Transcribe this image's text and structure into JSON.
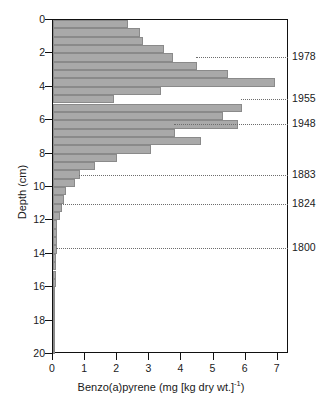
{
  "chart_data": {
    "type": "bar",
    "orientation": "horizontal",
    "title": "",
    "subtitle": "",
    "xlabel": "Benzo(a)pyrene (mg [kg dry wt.]⁻¹)",
    "xlabel_main": "Benzo(a)pyrene (mg [kg dry wt.]",
    "xlabel_sup": "-1",
    "xlabel_tail": ")",
    "ylabel": "Depth (cm)",
    "xlim": [
      0,
      7.35
    ],
    "ylim": [
      0,
      20
    ],
    "grid": false,
    "legend": null,
    "bar_interval_cm": 0.5,
    "bar_color": "#a9a9a9",
    "bar_edge_color": "#8a8a8a",
    "axis_color": "#111111",
    "xticks": [
      0,
      1,
      2,
      3,
      4,
      5,
      6,
      7
    ],
    "xtick_labels": [
      "0",
      "1",
      "2",
      "3",
      "4",
      "5",
      "6",
      "7"
    ],
    "yticks": [
      0,
      2,
      4,
      6,
      8,
      10,
      12,
      14,
      16,
      18,
      20
    ],
    "ytick_labels": [
      "0",
      "2",
      "4",
      "6",
      "8",
      "10",
      "12",
      "14",
      "16",
      "18",
      "20"
    ],
    "categories_depth_top_cm": [
      0.0,
      0.5,
      1.0,
      1.5,
      2.0,
      2.5,
      3.0,
      3.5,
      4.0,
      4.5,
      5.0,
      5.5,
      6.0,
      6.5,
      7.0,
      7.5,
      8.0,
      8.5,
      9.0,
      9.5,
      10.0,
      10.5,
      11.0,
      11.5,
      12.0,
      12.5,
      13.0,
      13.5,
      14.0,
      14.5,
      15.0,
      15.5,
      16.0,
      16.5,
      17.0,
      17.5,
      18.0,
      18.5,
      19.0,
      19.5
    ],
    "values": [
      2.35,
      2.7,
      2.8,
      3.45,
      3.75,
      4.5,
      5.45,
      6.9,
      3.35,
      1.9,
      5.9,
      5.3,
      5.75,
      3.8,
      4.6,
      3.05,
      2.0,
      1.3,
      0.85,
      0.7,
      0.42,
      0.35,
      0.28,
      0.22,
      0.14,
      0.12,
      0.11,
      0.11,
      0.1,
      0.09,
      0.09,
      0.08,
      0.07,
      0.06,
      0.05,
      0.05,
      0.04,
      0.04,
      0.04,
      0.03
    ],
    "annotations": [
      {
        "label": "1978",
        "depth_cm": 2.3,
        "value_at_line": 4.5
      },
      {
        "label": "1955",
        "depth_cm": 4.8,
        "value_at_line": 5.9
      },
      {
        "label": "1948",
        "depth_cm": 6.3,
        "value_at_line": 3.8
      },
      {
        "label": "1883",
        "depth_cm": 9.35,
        "value_at_line": 0.85
      },
      {
        "label": "1824",
        "depth_cm": 11.05,
        "value_at_line": 0.28
      },
      {
        "label": "1800",
        "depth_cm": 13.7,
        "value_at_line": 0.11
      }
    ]
  }
}
